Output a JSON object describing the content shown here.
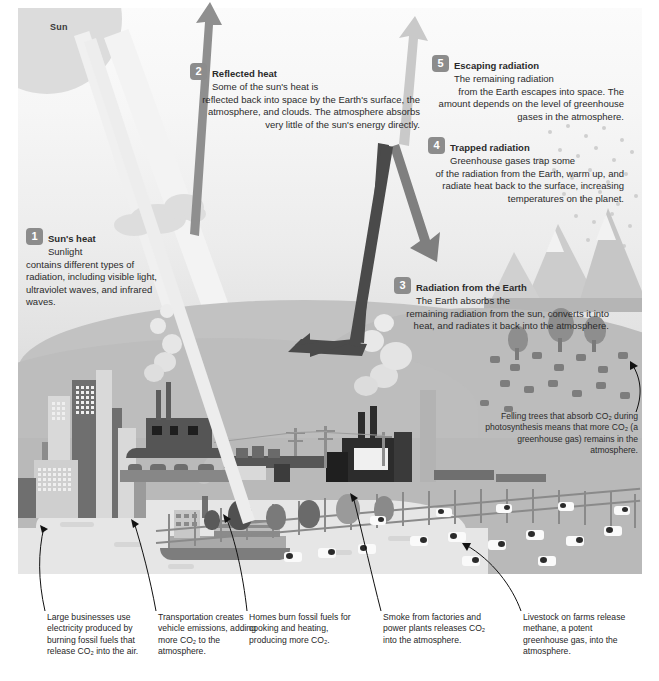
{
  "labels": {
    "sun": "Sun"
  },
  "colors": {
    "sky_top": "#fbfbfb",
    "sky_bottom": "#cfcfcf",
    "ground": "#b9b9b9",
    "badge": "#8c8c8c",
    "badge_text": "#ffffff",
    "arrow_reflected": "#8f8f8f",
    "arrow_escaping": "#c9c9c9",
    "arrow_trapped": "#7f7f7f",
    "arrow_earth": "#4a4a4a",
    "text": "#2b2b2b"
  },
  "callouts": [
    {
      "number": "1",
      "heading": "Sun's heat",
      "lead": "Sunlight",
      "body": "contains different types of radiation, including visible light, ultraviolet waves, and infrared waves."
    },
    {
      "number": "2",
      "heading": "Reflected heat",
      "lead": "Some of the sun's heat is",
      "body": "reflected back into space by the Earth's surface, the atmosphere, and clouds. The atmosphere absorbs very little of the sun's energy directly."
    },
    {
      "number": "3",
      "heading": "Radiation from the Earth",
      "lead": "The Earth absorbs the",
      "body": "remaining radiation from the sun, converts it into heat, and radiates it back into the atmosphere."
    },
    {
      "number": "4",
      "heading": "Trapped radiation",
      "lead": "Greenhouse gases trap some",
      "body": "of the radiation from the Earth, warm up, and radiate heat back to the surface, increasing temperatures on the planet."
    },
    {
      "number": "5",
      "heading": "Escaping radiation",
      "lead": "The remaining radiation",
      "body": "from the Earth escapes into space. The amount depends on the level of greenhouse gases in the atmosphere."
    }
  ],
  "notes": {
    "trees": "Felling trees that absorb CO₂ during photosynthesis means that more CO₂ (a greenhouse gas) remains in the atmosphere."
  },
  "captions": [
    {
      "id": "business",
      "text": "Large businesses use electricity produced by burning fossil fuels that release CO₂ into the air."
    },
    {
      "id": "transport",
      "text": "Transportation creates vehicle emissions, adding more CO₂ to the atmosphere."
    },
    {
      "id": "homes",
      "text": "Homes burn fossil fuels for cooking and heating, producing more CO₂."
    },
    {
      "id": "factories",
      "text": "Smoke from factories and power plants releases CO₂ into the atmosphere."
    },
    {
      "id": "livestock",
      "text": "Livestock on farms release methane, a potent greenhouse gas, into the atmosphere."
    }
  ]
}
